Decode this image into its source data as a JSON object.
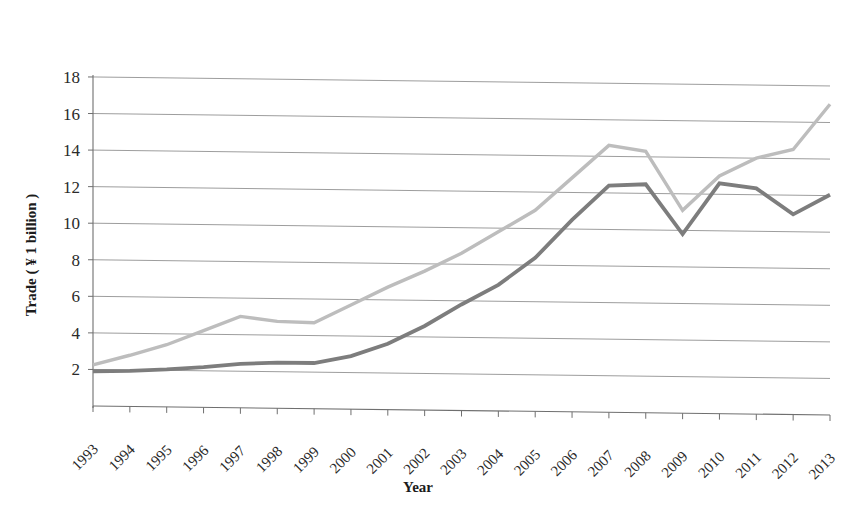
{
  "chart_data": {
    "type": "line",
    "title": "",
    "xlabel": "Year",
    "ylabel": "Trade ( ¥ 1 billion )",
    "grid": true,
    "legend": "none",
    "xlim": [
      1993,
      2013
    ],
    "ylim": [
      0,
      18
    ],
    "ytick_step": 2,
    "categories": [
      "1993",
      "1994",
      "1995",
      "1996",
      "1997",
      "1998",
      "1999",
      "2000",
      "2001",
      "2002",
      "2003",
      "2004",
      "2005",
      "2006",
      "2007",
      "2008",
      "2009",
      "2010",
      "2011",
      "2012",
      "2013"
    ],
    "ytick_labels": [
      "2",
      "4",
      "6",
      "8",
      "10",
      "12",
      "14",
      "16",
      "18"
    ],
    "ytick_values": [
      2,
      4,
      6,
      8,
      10,
      12,
      14,
      16,
      18
    ],
    "series": [
      {
        "name": "light-series",
        "color": "#bdbdbd",
        "stroke_width": 3.4,
        "values": [
          2.25,
          2.8,
          3.4,
          4.2,
          5.0,
          4.75,
          4.7,
          5.7,
          6.7,
          7.6,
          8.6,
          9.8,
          11.0,
          12.8,
          14.6,
          14.3,
          11.1,
          13.0,
          14.0,
          14.5,
          17.0
        ]
      },
      {
        "name": "dark-series",
        "color": "#7d7d7d",
        "stroke_width": 3.8,
        "values": [
          1.9,
          1.95,
          2.05,
          2.2,
          2.4,
          2.5,
          2.5,
          2.9,
          3.6,
          4.6,
          5.8,
          6.9,
          8.4,
          10.5,
          12.4,
          12.5,
          9.8,
          12.6,
          12.35,
          10.95,
          12.05
        ]
      }
    ]
  },
  "axes": {
    "x_axis_label": "Year",
    "y_axis_label": "Trade ( ¥ 1 billion )"
  }
}
